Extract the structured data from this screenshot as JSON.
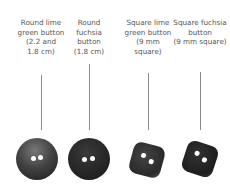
{
  "items": [
    {
      "label": [
        "Round lime",
        "green button",
        "(2.2 and",
        "1.8 cm)"
      ],
      "shape": "round"
    },
    {
      "label": [
        "Round",
        "fuchsia",
        "button",
        "(1.8 cm)"
      ],
      "shape": "round"
    },
    {
      "label": [
        "Square lime",
        "green button",
        "(9 mm",
        "square)"
      ],
      "shape": "square"
    },
    {
      "label": [
        "Square fuchsia",
        "button",
        "(9 mm square)"
      ],
      "shape": "square"
    }
  ]
}
